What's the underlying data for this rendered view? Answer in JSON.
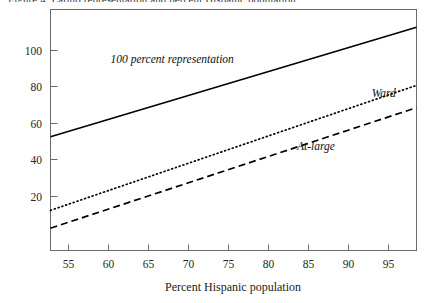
{
  "figure": {
    "clipped_caption": "Figure 4. Latino representation and percent Hispanic population",
    "background_color": "#ffffff",
    "frame_color": "#6b6b6b",
    "line_color": "#000000"
  },
  "chart_data": {
    "type": "line",
    "title": "",
    "xlabel": "Percent Hispanic population",
    "ylabel": "",
    "xlim": [
      52.75,
      98.6
    ],
    "ylim": [
      0,
      108
    ],
    "grid": false,
    "legend": "inline-labels",
    "x_ticks": [
      55,
      60,
      65,
      70,
      75,
      80,
      85,
      90,
      95
    ],
    "x_tick_labels": [
      "55",
      "60",
      "65",
      "70",
      "75",
      "80",
      "85",
      "90",
      "95"
    ],
    "y_ticks": [
      20,
      40,
      60,
      80,
      100
    ],
    "y_tick_labels": [
      "20",
      "40",
      "60",
      "80",
      "100"
    ],
    "series": [
      {
        "name": "100 percent representation",
        "style": "solid",
        "stroke_width": 1.6,
        "dash": "none",
        "label_x": 68,
        "label_y": 84,
        "x": [
          52.75,
          98.6
        ],
        "values": [
          51,
          100
        ]
      },
      {
        "name": "Ward",
        "style": "dotted",
        "stroke_width": 1.7,
        "dash": "1,3",
        "label_x": 94.5,
        "label_y": 69,
        "x": [
          52.75,
          98.6
        ],
        "values": [
          18,
          74
        ]
      },
      {
        "name": "At-large",
        "style": "dashed",
        "stroke_width": 1.7,
        "dash": "7,4",
        "label_x": 86,
        "label_y": 45,
        "x": [
          52.75,
          98.6
        ],
        "values": [
          10,
          64
        ]
      }
    ]
  },
  "labels": {
    "x_axis_title": "Percent Hispanic population",
    "series_full_representation": "100 percent representation",
    "series_ward": "Ward",
    "series_at_large": "At-large",
    "y_20": "20",
    "y_40": "40",
    "y_60": "60",
    "y_80": "80",
    "y_100": "100",
    "x_55": "55",
    "x_60": "60",
    "x_65": "65",
    "x_70": "70",
    "x_75": "75",
    "x_80": "80",
    "x_85": "85",
    "x_90": "90",
    "x_95": "95"
  }
}
